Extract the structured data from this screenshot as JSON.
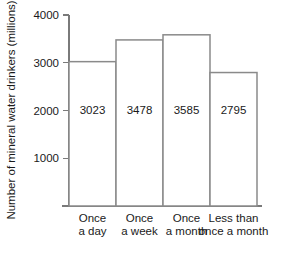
{
  "chart_data": {
    "type": "bar",
    "title": "",
    "subtitle": "",
    "xlabel": "",
    "ylabel": "Number of mineral water drinkers (millions)",
    "categories": [
      "Once a day",
      "Once a week",
      "Once a month",
      "Less than once a month"
    ],
    "category_lines": [
      [
        "Once",
        "a day"
      ],
      [
        "Once",
        "a week"
      ],
      [
        "Once",
        "a month"
      ],
      [
        "Less than",
        "once a month"
      ]
    ],
    "values": [
      3023,
      3478,
      3585,
      2795
    ],
    "value_labels": [
      "3023",
      "3478",
      "3585",
      "2795"
    ],
    "ylim": [
      0,
      4000
    ],
    "yticks": [
      1000,
      2000,
      3000,
      4000
    ],
    "ytick_labels": [
      "1000",
      "2000",
      "3000",
      "4000"
    ],
    "grid": false,
    "legend": false,
    "legend_position": "none",
    "bar_fill_color": "#ffffff",
    "bar_stroke_color": "#8a8a8a",
    "axis_color": "#7a7a7a",
    "text_color": "#1a1a1a"
  }
}
